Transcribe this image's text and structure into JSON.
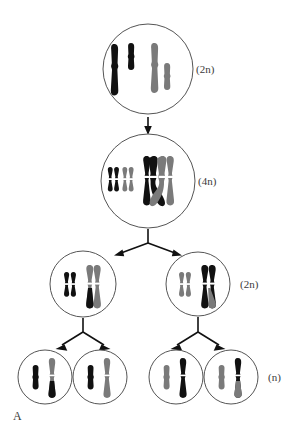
{
  "figure": {
    "panel_label": "A",
    "title_visible": false,
    "background": "#ffffff",
    "outline_color": "#555555",
    "colors": {
      "maternal": "#111111",
      "paternal": "#7a7a7a",
      "arrow": "#111111",
      "text": "#3a3a3a"
    }
  },
  "labels": {
    "parent_2n": "(2n)",
    "replicated_4n": "(4n)",
    "secondary_2n": "(2n)",
    "gamete_n": "(n)"
  },
  "stages": [
    {
      "id": "parent-cell",
      "name": "parent-cell",
      "ploidy": "(2n)",
      "cx": 148,
      "cy": 69,
      "r": 45,
      "chromosomes": [
        {
          "name": "long-black-unreplicated",
          "form": "rod",
          "color": "maternal",
          "x": 116,
          "y": 69,
          "len": 52,
          "w": 7
        },
        {
          "name": "short-black-unreplicated",
          "form": "rod",
          "color": "maternal",
          "x": 131,
          "y": 56,
          "len": 27,
          "w": 6
        },
        {
          "name": "long-gray-unreplicated",
          "form": "rod",
          "color": "paternal",
          "x": 154,
          "y": 67,
          "len": 50,
          "w": 7
        },
        {
          "name": "short-gray-unreplicated",
          "form": "rod",
          "color": "paternal",
          "x": 167,
          "y": 76,
          "len": 26,
          "w": 6
        }
      ]
    },
    {
      "id": "replicated-cell",
      "name": "replicated-cell",
      "ploidy": "(4n)",
      "cx": 148,
      "cy": 181,
      "r": 47,
      "chromosomes": [
        {
          "name": "short-black-replicated",
          "form": "x",
          "color": "maternal",
          "x": 113,
          "y": 179,
          "len": 26,
          "w": 5
        },
        {
          "name": "short-gray-replicated",
          "form": "x",
          "color": "paternal",
          "x": 127,
          "y": 179,
          "len": 26,
          "w": 5
        },
        {
          "name": "long-black-replicated-crossover",
          "form": "x",
          "color": "maternal",
          "x": 150,
          "y": 180,
          "len": 48,
          "w": 7
        },
        {
          "name": "long-gray-replicated-crossover",
          "form": "x",
          "color": "paternal",
          "x": 166,
          "y": 180,
          "len": 48,
          "w": 7
        }
      ]
    },
    {
      "id": "secondary-cell-left",
      "name": "secondary-cell-left",
      "ploidy": "",
      "cx": 83,
      "cy": 284,
      "r": 33,
      "chromosomes": [
        {
          "name": "short-black-replicated",
          "form": "x",
          "color": "maternal",
          "x": 68,
          "y": 284,
          "len": 22,
          "w": 5
        },
        {
          "name": "long-gray-recombinant-replicated",
          "form": "x",
          "color": "paternal",
          "x": 93,
          "y": 284,
          "len": 40,
          "w": 7
        }
      ]
    },
    {
      "id": "secondary-cell-right",
      "name": "secondary-cell-right",
      "ploidy": "(2n)",
      "cx": 198,
      "cy": 284,
      "r": 32,
      "chromosomes": [
        {
          "name": "short-gray-replicated",
          "form": "x",
          "color": "paternal",
          "x": 183,
          "y": 284,
          "len": 22,
          "w": 5
        },
        {
          "name": "long-black-recombinant-replicated",
          "form": "x",
          "color": "maternal",
          "x": 207,
          "y": 284,
          "len": 40,
          "w": 7
        }
      ]
    },
    {
      "id": "gamete-1",
      "name": "gamete-cell-1",
      "ploidy": "",
      "cx": 45,
      "cy": 377,
      "r": 27,
      "chromosomes": [
        {
          "name": "short-black-chromatid",
          "form": "rod",
          "color": "maternal",
          "x": 36,
          "y": 377,
          "len": 24,
          "w": 5
        },
        {
          "name": "long-recombinant-gray-black-chromatid",
          "form": "rod",
          "color": "recombinant-gray-top",
          "x": 52,
          "y": 377,
          "len": 38,
          "w": 6
        }
      ]
    },
    {
      "id": "gamete-2",
      "name": "gamete-cell-2",
      "ploidy": "",
      "cx": 100,
      "cy": 377,
      "r": 27,
      "chromosomes": [
        {
          "name": "short-black-chromatid",
          "form": "rod",
          "color": "maternal",
          "x": 91,
          "y": 377,
          "len": 24,
          "w": 5
        },
        {
          "name": "long-gray-chromatid",
          "form": "rod",
          "color": "paternal",
          "x": 107,
          "y": 377,
          "len": 38,
          "w": 6
        }
      ]
    },
    {
      "id": "gamete-3",
      "name": "gamete-cell-3",
      "ploidy": "",
      "cx": 176,
      "cy": 377,
      "r": 27,
      "chromosomes": [
        {
          "name": "short-gray-chromatid",
          "form": "rod",
          "color": "paternal",
          "x": 167,
          "y": 377,
          "len": 24,
          "w": 5
        },
        {
          "name": "long-black-chromatid",
          "form": "rod",
          "color": "maternal",
          "x": 183,
          "y": 377,
          "len": 38,
          "w": 6
        }
      ]
    },
    {
      "id": "gamete-4",
      "name": "gamete-cell-4",
      "ploidy": "(n)",
      "cx": 231,
      "cy": 377,
      "r": 27,
      "chromosomes": [
        {
          "name": "short-gray-chromatid",
          "form": "rod",
          "color": "paternal",
          "x": 222,
          "y": 377,
          "len": 24,
          "w": 5
        },
        {
          "name": "long-recombinant-black-gray-chromatid",
          "form": "rod",
          "color": "recombinant-black-top",
          "x": 238,
          "y": 377,
          "len": 38,
          "w": 6
        }
      ]
    }
  ],
  "arrows": [
    {
      "name": "arrow-replication",
      "kind": "straight",
      "from": "parent-cell",
      "to": "replicated-cell"
    },
    {
      "name": "arrow-meiosis-I-left",
      "kind": "branch",
      "from": "replicated-cell",
      "to": "secondary-cell-left"
    },
    {
      "name": "arrow-meiosis-I-right",
      "kind": "branch",
      "from": "replicated-cell",
      "to": "secondary-cell-right"
    },
    {
      "name": "arrow-meiosis-II-left-a",
      "kind": "branch",
      "from": "secondary-cell-left",
      "to": "gamete-cell-1"
    },
    {
      "name": "arrow-meiosis-II-left-b",
      "kind": "branch",
      "from": "secondary-cell-left",
      "to": "gamete-cell-2"
    },
    {
      "name": "arrow-meiosis-II-right-a",
      "kind": "branch",
      "from": "secondary-cell-right",
      "to": "gamete-cell-3"
    },
    {
      "name": "arrow-meiosis-II-right-b",
      "kind": "branch",
      "from": "secondary-cell-right",
      "to": "gamete-cell-4"
    }
  ]
}
